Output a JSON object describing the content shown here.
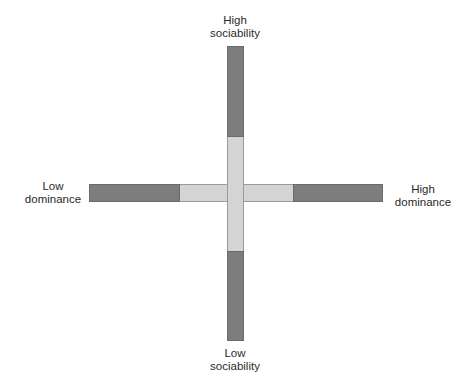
{
  "diagram": {
    "type": "two-axis personality grid",
    "colors": {
      "extreme_segment": "#7d7d7d",
      "center_segment": "#d4d4d4",
      "outline": "#6a6a6a"
    },
    "labels": {
      "top": {
        "line1": "High",
        "line2": "sociability"
      },
      "bottom": {
        "line1": "Low",
        "line2": "sociability"
      },
      "left": {
        "line1": "Low",
        "line2": "dominance"
      },
      "right": {
        "line1": "High",
        "line2": "dominance"
      }
    },
    "axes": {
      "vertical": {
        "name": "sociability",
        "low": "Low sociability",
        "high": "High sociability"
      },
      "horizontal": {
        "name": "dominance",
        "low": "Low dominance",
        "high": "High dominance"
      }
    }
  }
}
